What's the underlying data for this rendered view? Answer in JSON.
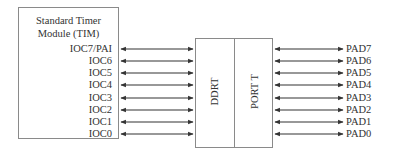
{
  "tim": {
    "title_line1": "Standard Timer",
    "title_line2": "Module (TIM)",
    "pins": [
      "IOC7/PAI",
      "IOC6",
      "IOC5",
      "IOC4",
      "IOC3",
      "IOC2",
      "IOC1",
      "IOC0"
    ]
  },
  "port": {
    "ddr_label": "DDRT",
    "port_label": "PORT T"
  },
  "pads": [
    "PAD7",
    "PAD6",
    "PAD5",
    "PAD4",
    "PAD3",
    "PAD2",
    "PAD1",
    "PAD0"
  ],
  "colors": {
    "line": "#333333",
    "box_border": "#8a8a8a"
  }
}
